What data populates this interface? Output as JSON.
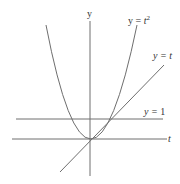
{
  "diagram": {
    "colors": {
      "background": "#ffffff",
      "stroke": "#6e6e6e",
      "text": "#333333"
    },
    "axes": {
      "horizontal_label": "t",
      "vertical_label": "y"
    },
    "curves": [
      {
        "id": "parabola",
        "label_prefix": "y = ",
        "label_var": "t",
        "label_sup": "2",
        "equation": "y = t^2"
      },
      {
        "id": "identity",
        "label_prefix": "y = ",
        "label_var": "t",
        "equation": "y = t"
      },
      {
        "id": "horizontal",
        "label_prefix": "y = ",
        "label_value": "1",
        "equation": "y = 1"
      }
    ]
  }
}
